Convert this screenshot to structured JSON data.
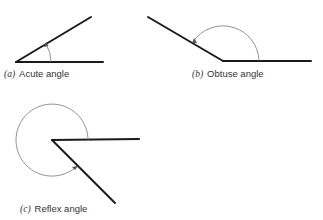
{
  "figures": [
    {
      "id": "a",
      "tag": "(a)",
      "label": "Acute angle",
      "angle_type": "acute"
    },
    {
      "id": "b",
      "tag": "(b)",
      "label": "Obtuse angle",
      "angle_type": "obtuse"
    },
    {
      "id": "c",
      "tag": "(c)",
      "label": "Reflex angle",
      "angle_type": "reflex"
    }
  ],
  "colors": {
    "ray": "#1a1a1a",
    "arc": "#777777",
    "text": "#333333"
  }
}
